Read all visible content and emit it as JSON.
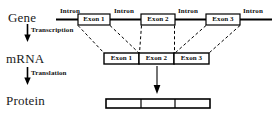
{
  "figure": {
    "background_color": "#ffffff",
    "line_color": "#000000",
    "text_color": "#1a1a1a",
    "width": 274,
    "height": 119
  },
  "rows": {
    "gene": {
      "label": "Gene",
      "introns": [
        {
          "label": "Intron",
          "x": 60,
          "y": 9
        },
        {
          "label": "Intron",
          "x": 113,
          "y": 9
        },
        {
          "label": "Intron",
          "x": 176,
          "y": 9
        },
        {
          "label": "Intron",
          "x": 241,
          "y": 9
        }
      ],
      "exons": [
        {
          "label": "Exon 1",
          "x": 78,
          "y": 14,
          "w": 32,
          "h": 11
        },
        {
          "label": "Exon 2",
          "x": 141,
          "y": 14,
          "w": 34,
          "h": 11
        },
        {
          "label": "Exon 3",
          "x": 206,
          "y": 14,
          "w": 34,
          "h": 11
        }
      ],
      "backbone": {
        "x1": 56,
        "x2": 272,
        "y": 19
      }
    },
    "mrna": {
      "label": "mRNA",
      "exons": [
        {
          "label": "Exon 1",
          "x": 104,
          "y": 53,
          "w": 35,
          "h": 11
        },
        {
          "label": "Exon 2",
          "x": 139,
          "y": 53,
          "w": 35,
          "h": 11
        },
        {
          "label": "Exon 3",
          "x": 174,
          "y": 53,
          "w": 35,
          "h": 11
        }
      ]
    },
    "protein": {
      "label": "Protein",
      "bar": {
        "x": 106,
        "y": 99,
        "w": 104,
        "h": 9
      },
      "segment_dividers": [
        141,
        175
      ]
    }
  },
  "steps": [
    {
      "label": "Transcription",
      "arrow_x": 27,
      "arrow_y1": 25,
      "arrow_y2": 41
    },
    {
      "label": "Translation",
      "arrow_x": 27,
      "arrow_y1": 68,
      "arrow_y2": 84
    }
  ],
  "splice_connectors": {
    "style": "dashed",
    "description": "dashed lines mapping gene exons down onto spliced mRNA exons"
  },
  "translation_arrow": {
    "x": 157,
    "y1": 66,
    "y2": 94
  }
}
